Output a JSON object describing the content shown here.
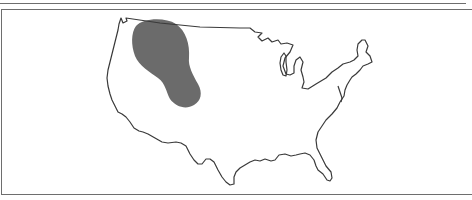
{
  "map": {
    "subject": "Contiguous United States outline",
    "highlighted_region": {
      "description": "Shaded area over northern Rocky Mountains / northern Great Plains",
      "fill_color": "#6b6b6b"
    },
    "outline_color": "#3a3a3a",
    "frame_color": "#6e6e6e",
    "background_color": "#ffffff"
  }
}
